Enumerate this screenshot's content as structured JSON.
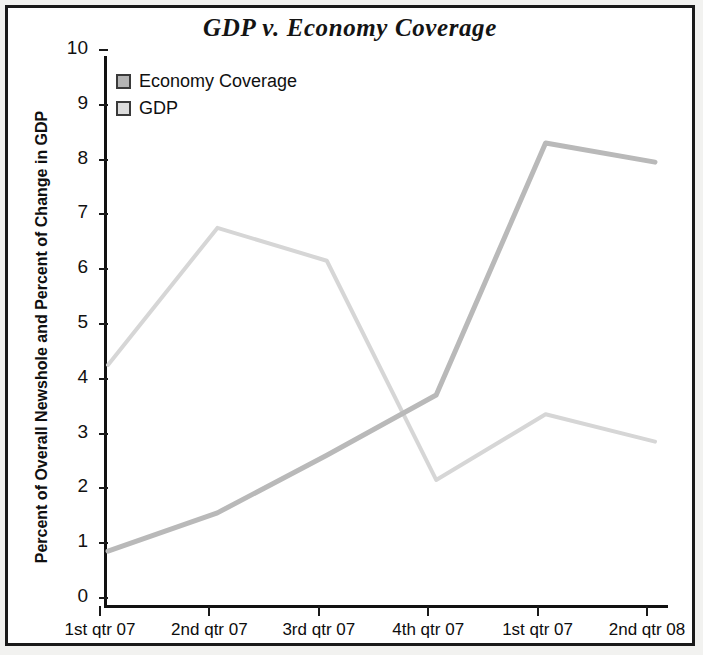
{
  "chart_data": {
    "type": "line",
    "title": "GDP v. Economy Coverage",
    "xlabel": "",
    "ylabel": "Percent of Overall Newshole and Percent of Change in GDP",
    "categories": [
      "1st qtr 07",
      "2nd qtr 07",
      "3rd qtr 07",
      "4th qtr 07",
      "1st qtr 07",
      "2nd qtr 08"
    ],
    "ylim": [
      0,
      10
    ],
    "yticks": [
      0,
      1,
      2,
      3,
      4,
      5,
      6,
      7,
      8,
      9,
      10
    ],
    "ytick_labels": [
      "0",
      "1",
      "2",
      "3",
      "4",
      "5",
      "6",
      "7",
      "8",
      "9",
      "10"
    ],
    "grid": false,
    "legend_position": "top-left",
    "series": [
      {
        "name": "Economy Coverage",
        "color": "#b9b9b9",
        "values": [
          1.0,
          1.7,
          2.75,
          3.85,
          8.45,
          8.1
        ]
      },
      {
        "name": "GDP",
        "color": "#d6d6d6",
        "values": [
          4.4,
          6.9,
          6.3,
          2.3,
          3.5,
          3.0
        ]
      }
    ]
  },
  "legend": {
    "items": [
      {
        "label": "Economy Coverage",
        "swatch_color": "#b4b4b4"
      },
      {
        "label": "GDP",
        "swatch_color": "#dcdcdc"
      }
    ]
  },
  "colors": {
    "frame": "#1a1a1a",
    "background": "#ffffff",
    "page_margin": "#f2f2f0",
    "axis": "#111111",
    "text": "#101010"
  }
}
